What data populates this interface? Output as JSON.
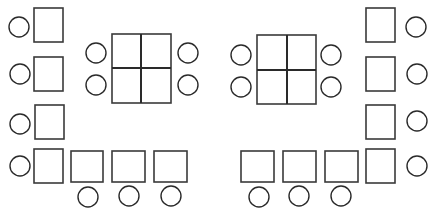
{
  "diagram": {
    "colors": {
      "stroke": "#3a3a3a",
      "fill": "#ffffff",
      "background": "#ffffff"
    },
    "desks": [
      {
        "id": "left-1",
        "x": 34,
        "y": 8,
        "w": 29,
        "h": 34
      },
      {
        "id": "left-2",
        "x": 34,
        "y": 57,
        "w": 29,
        "h": 34
      },
      {
        "id": "left-3",
        "x": 35,
        "y": 105,
        "w": 29,
        "h": 34
      },
      {
        "id": "left-4",
        "x": 34,
        "y": 149,
        "w": 29,
        "h": 34
      },
      {
        "id": "bottom-left-1",
        "x": 71,
        "y": 151,
        "w": 32,
        "h": 31
      },
      {
        "id": "bottom-left-2",
        "x": 112,
        "y": 151,
        "w": 33,
        "h": 31
      },
      {
        "id": "bottom-left-3",
        "x": 154,
        "y": 151,
        "w": 33,
        "h": 31
      },
      {
        "id": "bottom-right-1",
        "x": 241,
        "y": 151,
        "w": 33,
        "h": 31
      },
      {
        "id": "bottom-right-2",
        "x": 283,
        "y": 151,
        "w": 33,
        "h": 31
      },
      {
        "id": "bottom-right-3",
        "x": 325,
        "y": 151,
        "w": 33,
        "h": 31
      },
      {
        "id": "right-1",
        "x": 366,
        "y": 8,
        "w": 29,
        "h": 34
      },
      {
        "id": "right-2",
        "x": 366,
        "y": 57,
        "w": 29,
        "h": 34
      },
      {
        "id": "right-3",
        "x": 366,
        "y": 105,
        "w": 29,
        "h": 34
      },
      {
        "id": "right-4",
        "x": 366,
        "y": 149,
        "w": 29,
        "h": 34
      }
    ],
    "group_tables": [
      {
        "id": "center-left",
        "x": 112,
        "y": 34,
        "w": 59,
        "h": 69,
        "mid_x": 141,
        "mid_y": 68
      },
      {
        "id": "center-right",
        "x": 257,
        "y": 35,
        "w": 59,
        "h": 69,
        "mid_x": 287,
        "mid_y": 70
      }
    ],
    "seats": [
      {
        "id": "seat-left-1",
        "cx": 19,
        "cy": 27,
        "r": 10
      },
      {
        "id": "seat-left-2",
        "cx": 20,
        "cy": 74,
        "r": 10
      },
      {
        "id": "seat-left-3",
        "cx": 20,
        "cy": 124,
        "r": 10
      },
      {
        "id": "seat-left-4",
        "cx": 20,
        "cy": 166,
        "r": 10
      },
      {
        "id": "seat-bottom-left-1",
        "cx": 88,
        "cy": 197,
        "r": 10
      },
      {
        "id": "seat-bottom-left-2",
        "cx": 129,
        "cy": 196,
        "r": 10
      },
      {
        "id": "seat-bottom-left-3",
        "cx": 171,
        "cy": 196,
        "r": 10
      },
      {
        "id": "seat-table-left-1",
        "cx": 96,
        "cy": 53,
        "r": 10
      },
      {
        "id": "seat-table-left-2",
        "cx": 96,
        "cy": 85,
        "r": 10
      },
      {
        "id": "seat-table-left-3",
        "cx": 188,
        "cy": 53,
        "r": 10
      },
      {
        "id": "seat-table-left-4",
        "cx": 188,
        "cy": 85,
        "r": 10
      },
      {
        "id": "seat-table-right-1",
        "cx": 241,
        "cy": 55,
        "r": 10
      },
      {
        "id": "seat-table-right-2",
        "cx": 241,
        "cy": 87,
        "r": 10
      },
      {
        "id": "seat-table-right-3",
        "cx": 331,
        "cy": 55,
        "r": 10
      },
      {
        "id": "seat-table-right-4",
        "cx": 331,
        "cy": 87,
        "r": 10
      },
      {
        "id": "seat-bottom-right-1",
        "cx": 259,
        "cy": 197,
        "r": 10
      },
      {
        "id": "seat-bottom-right-2",
        "cx": 299,
        "cy": 196,
        "r": 10
      },
      {
        "id": "seat-bottom-right-3",
        "cx": 341,
        "cy": 196,
        "r": 10
      },
      {
        "id": "seat-right-1",
        "cx": 416,
        "cy": 27,
        "r": 10
      },
      {
        "id": "seat-right-2",
        "cx": 417,
        "cy": 74,
        "r": 10
      },
      {
        "id": "seat-right-3",
        "cx": 417,
        "cy": 121,
        "r": 10
      },
      {
        "id": "seat-right-4",
        "cx": 417,
        "cy": 166,
        "r": 10
      }
    ]
  }
}
